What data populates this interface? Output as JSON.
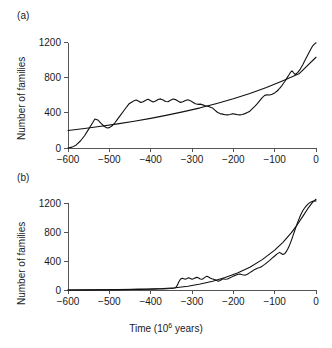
{
  "figure": {
    "background": "#ffffff",
    "line_color": "#111111",
    "axis_color": "#555555"
  },
  "panel_a": {
    "label": "(a)",
    "ylabel": "Number of families",
    "xlabel": "",
    "xticks": [
      "-600",
      "-500",
      "-400",
      "-300",
      "-200",
      "-100",
      "0"
    ],
    "yticks": [
      "0",
      "400",
      "800",
      "1200"
    ]
  },
  "panel_b": {
    "label": "(b)",
    "ylabel": "Number of families",
    "xlabel_prefix": "Time (10",
    "xlabel_exp": "6",
    "xlabel_suffix": " years)",
    "xticks": [
      "-600",
      "-500",
      "-400",
      "-300",
      "-200",
      "-100",
      "0"
    ],
    "yticks": [
      "0",
      "400",
      "800",
      "1200"
    ]
  },
  "chart_data": [
    {
      "type": "line",
      "title": "(a)",
      "xlabel": "Time (10^6 years)",
      "ylabel": "Number of families",
      "xlim": [
        -600,
        0
      ],
      "ylim": [
        0,
        1300
      ],
      "xticks": [
        -600,
        -500,
        -400,
        -300,
        -200,
        -100,
        0
      ],
      "yticks": [
        0,
        400,
        800,
        1200
      ],
      "grid": false,
      "legend": "none",
      "series": [
        {
          "name": "observed-family-diversity",
          "x": [
            -600,
            -590,
            -580,
            -570,
            -560,
            -550,
            -540,
            -535,
            -528,
            -520,
            -512,
            -505,
            -500,
            -494,
            -487,
            -480,
            -472,
            -465,
            -458,
            -452,
            -445,
            -440,
            -435,
            -430,
            -424,
            -418,
            -412,
            -406,
            -400,
            -394,
            -388,
            -382,
            -376,
            -370,
            -364,
            -358,
            -352,
            -346,
            -340,
            -334,
            -328,
            -322,
            -316,
            -310,
            -304,
            -298,
            -292,
            -286,
            -280,
            -274,
            -268,
            -262,
            -258,
            -254,
            -250,
            -244,
            -238,
            -232,
            -226,
            -220,
            -214,
            -208,
            -202,
            -196,
            -190,
            -184,
            -178,
            -172,
            -166,
            -160,
            -154,
            -148,
            -142,
            -136,
            -130,
            -124,
            -118,
            -112,
            -106,
            -100,
            -94,
            -88,
            -82,
            -76,
            -70,
            -66,
            -62,
            -58,
            -54,
            -50,
            -44,
            -38,
            -32,
            -26,
            -20,
            -14,
            -8,
            -4,
            0
          ],
          "y": [
            0,
            10,
            35,
            80,
            140,
            215,
            290,
            330,
            320,
            280,
            245,
            228,
            232,
            250,
            285,
            330,
            380,
            425,
            470,
            505,
            525,
            540,
            548,
            535,
            520,
            528,
            545,
            555,
            540,
            525,
            535,
            552,
            560,
            548,
            530,
            528,
            545,
            558,
            552,
            535,
            520,
            528,
            542,
            550,
            540,
            522,
            505,
            498,
            500,
            492,
            482,
            476,
            470,
            462,
            455,
            430,
            405,
            392,
            386,
            380,
            378,
            382,
            390,
            386,
            380,
            378,
            382,
            392,
            404,
            420,
            448,
            475,
            505,
            540,
            575,
            600,
            608,
            604,
            612,
            628,
            650,
            680,
            715,
            755,
            800,
            830,
            862,
            880,
            858,
            838,
            862,
            900,
            950,
            1005,
            1060,
            1115,
            1165,
            1185,
            1200
          ]
        },
        {
          "name": "fitted-exponential-trend",
          "x": [
            -600,
            -560,
            -520,
            -480,
            -440,
            -400,
            -360,
            -320,
            -280,
            -240,
            -200,
            -160,
            -120,
            -80,
            -40,
            0
          ],
          "y": [
            200,
            222,
            248,
            275,
            305,
            338,
            375,
            415,
            458,
            508,
            562,
            622,
            690,
            768,
            850,
            1035
          ]
        }
      ]
    },
    {
      "type": "line",
      "title": "(b)",
      "xlabel": "Time (10^6 years)",
      "ylabel": "Number of families",
      "xlim": [
        -600,
        0
      ],
      "ylim": [
        0,
        1300
      ],
      "xticks": [
        -600,
        -500,
        -400,
        -300,
        -200,
        -100,
        0
      ],
      "yticks": [
        0,
        400,
        800,
        1200
      ],
      "grid": false,
      "legend": "none",
      "series": [
        {
          "name": "observed-family-diversity",
          "x": [
            -600,
            -560,
            -520,
            -480,
            -450,
            -430,
            -410,
            -395,
            -380,
            -370,
            -360,
            -352,
            -345,
            -340,
            -336,
            -332,
            -328,
            -324,
            -320,
            -316,
            -312,
            -308,
            -304,
            -300,
            -296,
            -292,
            -288,
            -284,
            -280,
            -276,
            -272,
            -268,
            -264,
            -260,
            -256,
            -252,
            -248,
            -244,
            -240,
            -236,
            -232,
            -228,
            -224,
            -220,
            -214,
            -208,
            -202,
            -196,
            -190,
            -184,
            -178,
            -172,
            -166,
            -160,
            -154,
            -148,
            -142,
            -136,
            -130,
            -124,
            -118,
            -112,
            -106,
            -100,
            -94,
            -88,
            -84,
            -80,
            -76,
            -72,
            -68,
            -64,
            -60,
            -56,
            -52,
            -48,
            -44,
            -40,
            -36,
            -32,
            -28,
            -24,
            -20,
            -16,
            -12,
            -8,
            -4,
            0
          ],
          "y": [
            0,
            0,
            2,
            4,
            6,
            8,
            10,
            12,
            14,
            16,
            18,
            20,
            24,
            30,
            60,
            110,
            150,
            162,
            155,
            148,
            158,
            170,
            160,
            150,
            155,
            168,
            175,
            165,
            152,
            148,
            160,
            178,
            190,
            180,
            166,
            155,
            150,
            142,
            130,
            120,
            132,
            145,
            155,
            148,
            152,
            168,
            185,
            200,
            215,
            222,
            212,
            205,
            218,
            240,
            262,
            285,
            300,
            312,
            330,
            355,
            382,
            410,
            440,
            470,
            500,
            520,
            505,
            490,
            500,
            530,
            570,
            620,
            680,
            745,
            812,
            880,
            940,
            998,
            1050,
            1095,
            1130,
            1160,
            1185,
            1205,
            1218,
            1226,
            1230,
            1232
          ]
        },
        {
          "name": "fitted-exponential-trend",
          "x": [
            -600,
            -560,
            -520,
            -480,
            -440,
            -400,
            -370,
            -340,
            -310,
            -280,
            -250,
            -220,
            -190,
            -160,
            -130,
            -100,
            -80,
            -60,
            -45,
            -30,
            -18,
            -8,
            0
          ],
          "y": [
            1,
            2,
            3,
            5,
            8,
            13,
            20,
            32,
            52,
            82,
            122,
            172,
            235,
            315,
            420,
            552,
            660,
            790,
            905,
            1035,
            1140,
            1215,
            1255
          ]
        }
      ]
    }
  ]
}
